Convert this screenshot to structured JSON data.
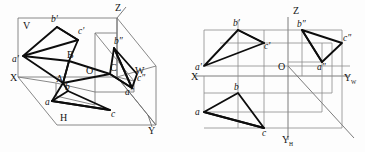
{
  "figure": {
    "caption_left": "Pictorial (axonometric) view of triangle ABC in the three-projection-plane system",
    "caption_right": "Orthographic multiview (three-view) layout of the same triangle",
    "line_color": "#0d0d0d",
    "axis_color": "#6d6d6d",
    "grid_color": "#8a8a8a",
    "background": "#fdfdfd"
  },
  "left_view": {
    "name": "axonometric-view",
    "axes": [
      {
        "id": "Z",
        "label": "Z",
        "x": 117,
        "y": 10
      },
      {
        "id": "X",
        "label": "X",
        "x": 12,
        "y": 77
      },
      {
        "id": "Y",
        "label": "Y",
        "x": 148,
        "y": 130
      }
    ],
    "planes": [
      {
        "id": "V",
        "label": "V",
        "x": 23,
        "y": 25
      },
      {
        "id": "H",
        "label": "H",
        "x": 60,
        "y": 117
      },
      {
        "id": "W",
        "label": "W",
        "x": 135,
        "y": 70
      }
    ],
    "points": [
      {
        "id": "a_prime",
        "label": "a'",
        "x": 17,
        "y": 59
      },
      {
        "id": "b_prime",
        "label": "b'",
        "x": 55,
        "y": 24
      },
      {
        "id": "c_prime",
        "label": "c'",
        "x": 80,
        "y": 36
      },
      {
        "id": "A",
        "label": "A",
        "x": 58,
        "y": 83
      },
      {
        "id": "B",
        "label": "B",
        "x": 69,
        "y": 55
      },
      {
        "id": "C",
        "label": "C",
        "x": 113,
        "y": 68
      },
      {
        "id": "a",
        "label": "a",
        "x": 48,
        "y": 104
      },
      {
        "id": "b",
        "label": "b",
        "x": 67,
        "y": 96
      },
      {
        "id": "c",
        "label": "c",
        "x": 112,
        "y": 113
      },
      {
        "id": "a_dprime",
        "label": "a″",
        "x": 127,
        "y": 91
      },
      {
        "id": "b_dprime",
        "label": "b″",
        "x": 118,
        "y": 45
      },
      {
        "id": "c_dprime",
        "label": "c″",
        "x": 138,
        "y": 79
      }
    ]
  },
  "right_view": {
    "name": "orthographic-three-view",
    "axes": [
      {
        "id": "Z",
        "label": "Z",
        "sub": "",
        "x": 296,
        "y": 12
      },
      {
        "id": "X",
        "label": "X",
        "sub": "",
        "x": 193,
        "y": 78
      },
      {
        "id": "YW",
        "label": "Y",
        "sub": "W",
        "x": 347,
        "y": 80
      },
      {
        "id": "YH",
        "label": "Y",
        "sub": "H",
        "x": 288,
        "y": 140
      }
    ],
    "origin": {
      "id": "O",
      "label": "O",
      "x": 288,
      "y": 66
    },
    "points": [
      {
        "id": "a_prime",
        "label": "a'",
        "x": 201,
        "y": 56
      },
      {
        "id": "b_prime",
        "label": "b'",
        "x": 231,
        "y": 25
      },
      {
        "id": "c_prime",
        "label": "c'",
        "x": 263,
        "y": 45
      },
      {
        "id": "b_dprime",
        "label": "b″",
        "x": 303,
        "y": 26
      },
      {
        "id": "c_dprime",
        "label": "c″",
        "x": 345,
        "y": 35
      },
      {
        "id": "a_dprime",
        "label": "a″",
        "x": 323,
        "y": 62
      },
      {
        "id": "a",
        "label": "a",
        "x": 201,
        "y": 112
      },
      {
        "id": "b",
        "label": "b",
        "x": 237,
        "y": 93
      },
      {
        "id": "c",
        "label": "c",
        "x": 263,
        "y": 128
      }
    ]
  }
}
